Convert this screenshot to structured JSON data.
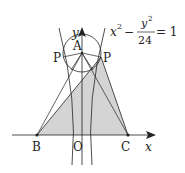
{
  "equation": {
    "lhs_x": "x",
    "x_exp": "2",
    "minus": "−",
    "num_y": "y",
    "y_exp": "2",
    "den": "24",
    "rhs": "= 1"
  },
  "labels": {
    "A": "A",
    "P_left": "P",
    "P_right": "P",
    "B": "B",
    "O": "O",
    "C": "C",
    "x_axis": "x",
    "y_axis": "y"
  },
  "colors": {
    "stroke": "#222222",
    "shade": "#d4d4d4"
  }
}
